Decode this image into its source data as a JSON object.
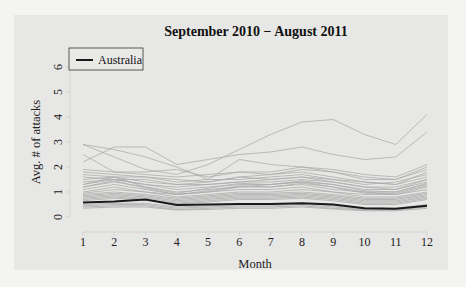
{
  "chart_data": {
    "type": "line",
    "title": "September 2010 − August 2011",
    "xlabel": "Month",
    "ylabel": "Avg. # of attacks",
    "x": [
      1,
      2,
      3,
      4,
      5,
      6,
      7,
      8,
      9,
      10,
      11,
      12
    ],
    "x_ticks": [
      "1",
      "2",
      "3",
      "4",
      "5",
      "6",
      "7",
      "8",
      "9",
      "10",
      "11",
      "12"
    ],
    "y_ticks": [
      "0",
      "1",
      "2",
      "3",
      "4",
      "5",
      "6"
    ],
    "xlim": [
      1,
      12
    ],
    "ylim": [
      0,
      6
    ],
    "grid": false,
    "legend": {
      "position": "top-left",
      "entries": [
        "Australia"
      ]
    },
    "highlight_series": {
      "name": "Australia",
      "color": "#1a1a1a",
      "values": [
        0.58,
        0.62,
        0.7,
        0.48,
        0.5,
        0.52,
        0.52,
        0.55,
        0.5,
        0.35,
        0.33,
        0.45
      ]
    },
    "background_series_color": "#a9a9a9",
    "background_series": [
      [
        2.9,
        2.4,
        1.9,
        1.7,
        2.1,
        2.7,
        3.3,
        3.8,
        3.9,
        3.3,
        2.9,
        4.1
      ],
      [
        2.2,
        2.8,
        2.8,
        2.1,
        2.3,
        2.5,
        2.6,
        2.8,
        2.5,
        2.3,
        2.4,
        3.4
      ],
      [
        2.9,
        2.7,
        2.4,
        2.0,
        1.5,
        2.3,
        2.1,
        2.0,
        1.9,
        1.7,
        1.6,
        2.1
      ],
      [
        2.5,
        1.8,
        1.8,
        1.9,
        1.6,
        1.8,
        1.7,
        1.9,
        1.8,
        1.5,
        1.5,
        2.0
      ],
      [
        1.9,
        1.8,
        1.7,
        1.6,
        1.7,
        1.8,
        1.8,
        2.0,
        1.8,
        1.6,
        1.5,
        1.9
      ],
      [
        1.8,
        1.7,
        1.6,
        1.5,
        1.4,
        1.6,
        1.7,
        1.8,
        1.6,
        1.4,
        1.3,
        1.8
      ],
      [
        1.7,
        1.6,
        1.6,
        1.4,
        1.5,
        1.5,
        1.6,
        1.7,
        1.5,
        1.3,
        1.4,
        1.7
      ],
      [
        1.6,
        1.5,
        1.5,
        1.3,
        1.4,
        1.6,
        1.5,
        1.6,
        1.5,
        1.4,
        1.3,
        1.6
      ],
      [
        1.5,
        1.6,
        1.4,
        1.3,
        1.3,
        1.4,
        1.5,
        1.6,
        1.4,
        1.2,
        1.2,
        1.5
      ],
      [
        1.4,
        1.5,
        1.3,
        1.2,
        1.3,
        1.4,
        1.4,
        1.5,
        1.4,
        1.2,
        1.1,
        1.5
      ],
      [
        1.3,
        1.5,
        1.3,
        1.1,
        1.2,
        1.3,
        1.3,
        1.4,
        1.3,
        1.1,
        1.1,
        1.4
      ],
      [
        1.2,
        1.4,
        1.2,
        1.0,
        1.1,
        1.2,
        1.3,
        1.4,
        1.2,
        1.0,
        1.0,
        1.3
      ],
      [
        1.1,
        1.3,
        1.1,
        0.9,
        1.0,
        1.2,
        1.2,
        1.3,
        1.1,
        1.0,
        0.9,
        1.2
      ],
      [
        1.0,
        1.2,
        1.0,
        0.9,
        1.0,
        1.1,
        1.1,
        1.2,
        1.0,
        0.9,
        0.9,
        1.1
      ],
      [
        0.95,
        1.1,
        1.0,
        0.8,
        0.9,
        1.0,
        1.0,
        1.1,
        1.0,
        0.8,
        0.8,
        1.0
      ],
      [
        0.9,
        1.0,
        0.9,
        0.75,
        0.85,
        0.95,
        0.95,
        1.0,
        0.9,
        0.75,
        0.75,
        0.95
      ],
      [
        0.85,
        0.95,
        0.85,
        0.7,
        0.8,
        0.9,
        0.9,
        0.95,
        0.85,
        0.7,
        0.7,
        0.9
      ],
      [
        0.8,
        0.9,
        0.8,
        0.65,
        0.75,
        0.85,
        0.85,
        0.9,
        0.8,
        0.65,
        0.65,
        0.85
      ],
      [
        0.75,
        0.85,
        0.75,
        0.6,
        0.7,
        0.8,
        0.8,
        0.85,
        0.75,
        0.6,
        0.6,
        0.8
      ],
      [
        0.7,
        0.8,
        0.7,
        0.55,
        0.65,
        0.75,
        0.75,
        0.8,
        0.7,
        0.55,
        0.55,
        0.75
      ],
      [
        0.65,
        0.75,
        0.68,
        0.52,
        0.6,
        0.7,
        0.7,
        0.75,
        0.65,
        0.5,
        0.5,
        0.7
      ],
      [
        0.5,
        0.55,
        0.55,
        0.4,
        0.45,
        0.5,
        0.5,
        0.55,
        0.45,
        0.35,
        0.35,
        0.5
      ],
      [
        0.45,
        0.5,
        0.5,
        0.35,
        0.4,
        0.45,
        0.45,
        0.5,
        0.4,
        0.3,
        0.3,
        0.45
      ],
      [
        0.4,
        0.45,
        0.45,
        0.3,
        0.35,
        0.4,
        0.4,
        0.45,
        0.35,
        0.28,
        0.28,
        0.4
      ],
      [
        0.35,
        0.4,
        0.4,
        0.28,
        0.3,
        0.35,
        0.35,
        0.4,
        0.32,
        0.25,
        0.25,
        0.35
      ],
      [
        1.3,
        1.6,
        1.2,
        0.95,
        1.15,
        1.35,
        1.3,
        1.45,
        1.3,
        1.05,
        1.0,
        1.35
      ],
      [
        1.2,
        1.45,
        1.15,
        0.9,
        1.05,
        1.25,
        1.2,
        1.35,
        1.2,
        0.95,
        0.95,
        1.25
      ]
    ]
  }
}
